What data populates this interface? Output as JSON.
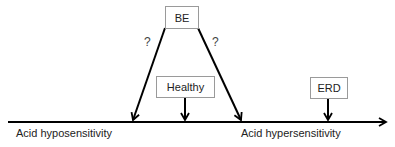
{
  "diagram": {
    "axis": {
      "left_label": "Acid hyposensitivity",
      "right_label": "Acid hypersensitivity"
    },
    "nodes": {
      "be": "BE",
      "healthy": "Healthy",
      "erd": "ERD"
    },
    "question_marks": [
      "?",
      "?"
    ],
    "colors": {
      "line": "#000000",
      "box_border": "#9a9a9a",
      "text": "#222222"
    }
  }
}
